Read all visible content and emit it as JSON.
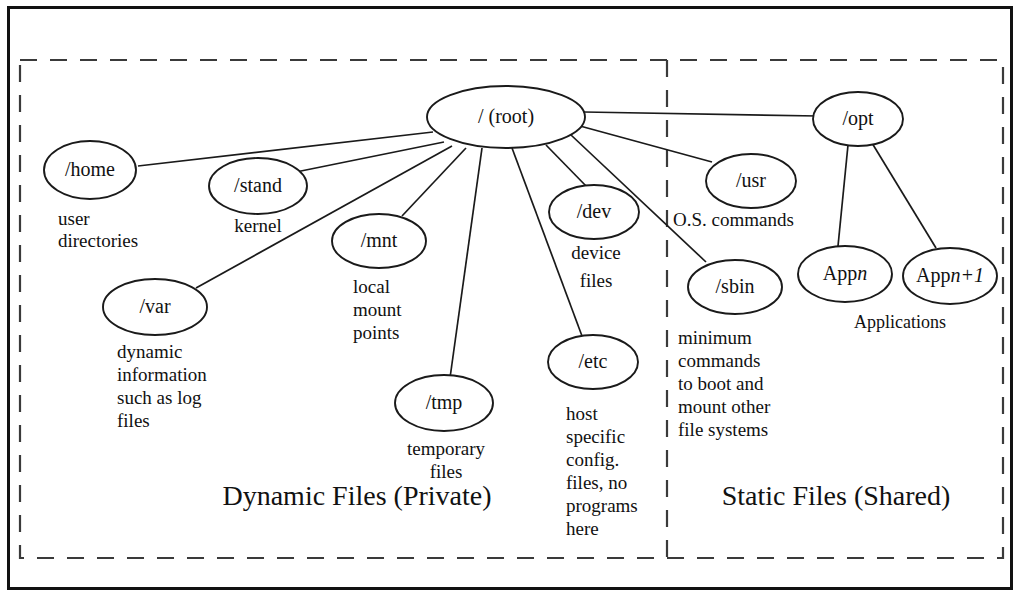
{
  "diagram": {
    "zones": [
      {
        "id": "dynamic",
        "label": "Dynamic Files (Private)"
      },
      {
        "id": "static",
        "label": "Static Files (Shared)"
      }
    ],
    "root": {
      "id": "root",
      "label": "/ (root)"
    },
    "nodes": [
      {
        "id": "home",
        "label": "/home",
        "desc": [
          "user",
          "directories"
        ]
      },
      {
        "id": "stand",
        "label": "/stand",
        "desc": [
          "kernel"
        ]
      },
      {
        "id": "var",
        "label": "/var",
        "desc": [
          "dynamic",
          "information",
          "such as log",
          "files"
        ]
      },
      {
        "id": "mnt",
        "label": "/mnt",
        "desc": [
          "local",
          "mount",
          "points"
        ]
      },
      {
        "id": "tmp",
        "label": "/tmp",
        "desc": [
          "temporary",
          "files"
        ]
      },
      {
        "id": "dev",
        "label": "/dev",
        "desc": [
          "device",
          "files"
        ]
      },
      {
        "id": "etc",
        "label": "/etc",
        "desc": [
          "host",
          "specific",
          "config.",
          "files, no",
          "programs",
          "here"
        ]
      },
      {
        "id": "sbin",
        "label": "/sbin",
        "desc": [
          "minimum",
          "commands",
          "to boot and",
          "mount other",
          "file systems"
        ]
      },
      {
        "id": "usr",
        "label": "/usr",
        "desc": [
          "O.S. commands"
        ]
      },
      {
        "id": "opt",
        "label": "/opt",
        "desc": []
      },
      {
        "id": "appn",
        "label_prefix": "App",
        "label_italic": "n",
        "label_suffix": "",
        "desc": []
      },
      {
        "id": "appn1",
        "label_prefix": "App",
        "label_italic": "n+1",
        "label_suffix": "",
        "desc": []
      }
    ],
    "group_labels": [
      {
        "id": "applications",
        "label": "Applications"
      }
    ],
    "edges": [
      {
        "from": "root",
        "to": "home"
      },
      {
        "from": "root",
        "to": "stand"
      },
      {
        "from": "root",
        "to": "var"
      },
      {
        "from": "root",
        "to": "mnt"
      },
      {
        "from": "root",
        "to": "tmp"
      },
      {
        "from": "root",
        "to": "dev"
      },
      {
        "from": "root",
        "to": "etc"
      },
      {
        "from": "root",
        "to": "sbin"
      },
      {
        "from": "root",
        "to": "usr"
      },
      {
        "from": "root",
        "to": "opt"
      },
      {
        "from": "opt",
        "to": "appn"
      },
      {
        "from": "opt",
        "to": "appn1"
      }
    ],
    "colors": {
      "frame": "#111111",
      "dashed": "#3a3a3a",
      "line": "#1a1a1a",
      "text": "#111111",
      "background": "#ffffff"
    }
  }
}
